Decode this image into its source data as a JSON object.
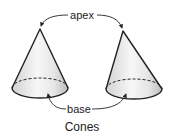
{
  "diagram": {
    "title": "Cones",
    "labels": {
      "apex": "apex",
      "base": "base"
    },
    "colors": {
      "outline": "#222222",
      "fill_light": "#f2f2f2",
      "fill_dark": "#cfcfcf",
      "text": "#222222"
    },
    "shapes": [
      {
        "name": "left-cone",
        "type": "cone"
      },
      {
        "name": "right-cone",
        "type": "cone"
      }
    ]
  }
}
